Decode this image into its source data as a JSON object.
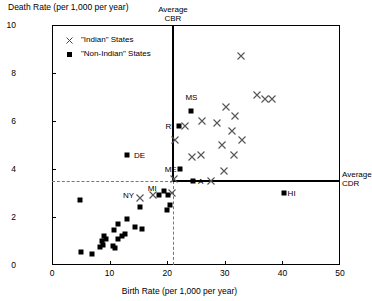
{
  "chart_data": {
    "type": "scatter",
    "title": "",
    "xlabel": "Birth Rate (per 1,000 per year)",
    "ylabel": "Death Rate (per 1,000 per year)",
    "xlim": [
      0,
      50
    ],
    "ylim": [
      0,
      10
    ],
    "xticks": [
      0,
      10,
      20,
      30,
      40,
      50
    ],
    "yticks": [
      0,
      2,
      4,
      6,
      8,
      10
    ],
    "grid": false,
    "legend_position": "top-left",
    "legend": [
      {
        "label": "\"Indian\" States",
        "marker": "x"
      },
      {
        "label": "\"Non-Indian\" States",
        "marker": "square"
      }
    ],
    "reference_lines": [
      {
        "name": "Average CBR",
        "orientation": "vertical",
        "value": 21.0,
        "style": "solid-upper-dashed-lower",
        "label": "Average\nCBR"
      },
      {
        "name": "Average CDR",
        "orientation": "horizontal",
        "value": 3.5,
        "style": "solid-right-dashed-left",
        "label": "Average\nCDR"
      }
    ],
    "series": [
      {
        "name": "\"Indian\" States",
        "marker": "x",
        "points": [
          {
            "x": 32.8,
            "y": 8.7
          },
          {
            "x": 35.6,
            "y": 7.1
          },
          {
            "x": 37.0,
            "y": 6.9
          },
          {
            "x": 38.2,
            "y": 6.9
          },
          {
            "x": 30.2,
            "y": 6.6
          },
          {
            "x": 31.8,
            "y": 6.2
          },
          {
            "x": 26.0,
            "y": 6.0
          },
          {
            "x": 28.6,
            "y": 5.9
          },
          {
            "x": 31.2,
            "y": 5.6
          },
          {
            "x": 23.1,
            "y": 5.8
          },
          {
            "x": 33.0,
            "y": 5.2
          },
          {
            "x": 21.4,
            "y": 5.2
          },
          {
            "x": 29.5,
            "y": 5.0
          },
          {
            "x": 31.6,
            "y": 4.6
          },
          {
            "x": 24.3,
            "y": 4.5
          },
          {
            "x": 25.9,
            "y": 4.6
          },
          {
            "x": 29.9,
            "y": 3.9
          },
          {
            "x": 21.2,
            "y": 3.6
          },
          {
            "x": 27.6,
            "y": 3.5
          },
          {
            "x": 20.9,
            "y": 3.0
          },
          {
            "x": 17.6,
            "y": 2.9
          },
          {
            "x": 15.2,
            "y": 2.8
          }
        ]
      },
      {
        "name": "\"Non-Indian\" States",
        "marker": "square",
        "points": [
          {
            "x": 24.2,
            "y": 6.4
          },
          {
            "x": 22.1,
            "y": 5.8
          },
          {
            "x": 22.3,
            "y": 4.0
          },
          {
            "x": 24.5,
            "y": 3.5
          },
          {
            "x": 13.0,
            "y": 4.6
          },
          {
            "x": 40.2,
            "y": 3.0
          },
          {
            "x": 4.9,
            "y": 2.7
          },
          {
            "x": 19.5,
            "y": 3.1
          },
          {
            "x": 18.6,
            "y": 2.9
          },
          {
            "x": 20.2,
            "y": 2.9
          },
          {
            "x": 20.4,
            "y": 2.5
          },
          {
            "x": 19.9,
            "y": 2.3
          },
          {
            "x": 15.2,
            "y": 2.4
          },
          {
            "x": 13.0,
            "y": 1.9
          },
          {
            "x": 11.5,
            "y": 1.7
          },
          {
            "x": 14.4,
            "y": 1.6
          },
          {
            "x": 15.6,
            "y": 1.5
          },
          {
            "x": 12.6,
            "y": 1.3
          },
          {
            "x": 9.1,
            "y": 1.2
          },
          {
            "x": 9.4,
            "y": 1.1
          },
          {
            "x": 11.5,
            "y": 1.1
          },
          {
            "x": 12.1,
            "y": 1.2
          },
          {
            "x": 8.7,
            "y": 1.0
          },
          {
            "x": 8.9,
            "y": 0.85
          },
          {
            "x": 8.3,
            "y": 0.75
          },
          {
            "x": 10.6,
            "y": 0.8
          },
          {
            "x": 11.0,
            "y": 0.7
          },
          {
            "x": 5.0,
            "y": 0.55
          },
          {
            "x": 7.0,
            "y": 0.45
          },
          {
            "x": 10.8,
            "y": 1.45
          }
        ]
      }
    ],
    "point_labels": [
      {
        "text": "MS",
        "x": 24.2,
        "y": 7.0
      },
      {
        "text": "RI",
        "x": 20.4,
        "y": 5.8
      },
      {
        "text": "ME",
        "x": 20.6,
        "y": 4.0
      },
      {
        "text": "A",
        "x": 25.8,
        "y": 3.5
      },
      {
        "text": "DE",
        "x": 15.2,
        "y": 4.6
      },
      {
        "text": "NY",
        "x": 13.3,
        "y": 2.9
      },
      {
        "text": "MI",
        "x": 17.4,
        "y": 3.2
      },
      {
        "text": "HI",
        "x": 41.6,
        "y": 3.0
      }
    ]
  }
}
